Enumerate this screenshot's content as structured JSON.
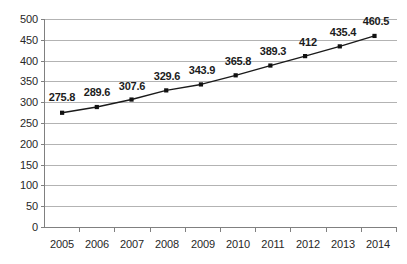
{
  "chart_data": {
    "type": "line",
    "title": "",
    "subtitle": "",
    "xlabel": "",
    "ylabel": "",
    "categories": [
      "2005",
      "2006",
      "2007",
      "2008",
      "2009",
      "2010",
      "2011",
      "2012",
      "2013",
      "2014"
    ],
    "values": [
      275.8,
      289.6,
      307.6,
      329.6,
      343.9,
      365.8,
      389.3,
      412,
      435.4,
      460.5
    ],
    "point_labels": [
      "275.8",
      "289.6",
      "307.6",
      "329.6",
      "343.9",
      "365.8",
      "389.3",
      "412",
      "435.4",
      "460.5"
    ],
    "series": [
      {
        "name": "",
        "values": [
          275.8,
          289.6,
          307.6,
          329.6,
          343.9,
          365.8,
          389.3,
          412,
          435.4,
          460.5
        ]
      }
    ],
    "ylim": [
      0,
      500
    ],
    "yticks": [
      0,
      50,
      100,
      150,
      200,
      250,
      300,
      350,
      400,
      450,
      500
    ],
    "ytick_labels": [
      "0",
      "50",
      "100",
      "150",
      "200",
      "250",
      "300",
      "350",
      "400",
      "450",
      "500"
    ],
    "xtick_labels": [
      "2005",
      "2006",
      "2007",
      "2008",
      "2009",
      "2010",
      "2011",
      "2012",
      "2013",
      "2014"
    ],
    "grid": true,
    "grid_axis": "y",
    "legend": false,
    "legend_position": "none",
    "data_labels_shown": true,
    "marker": "square",
    "colors": {
      "line": "#1a1a1a",
      "marker": "#111111",
      "gridline": "#b3b3b3",
      "axis": "#808080",
      "tick_text": "#272727",
      "label_text": "#1c1c1c",
      "background": "#ffffff"
    }
  }
}
